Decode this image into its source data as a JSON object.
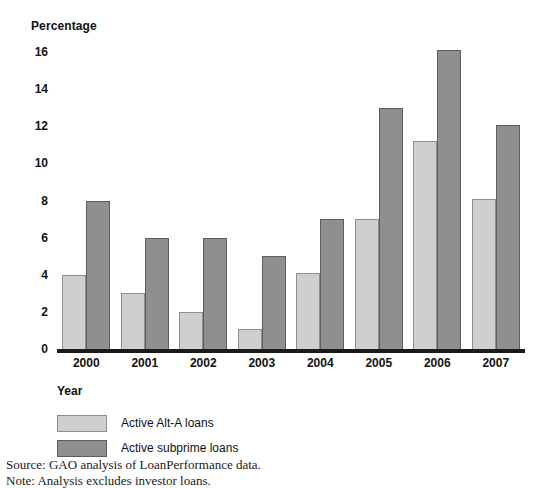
{
  "chart_data": {
    "type": "bar",
    "title": "",
    "ylabel": "Percentage",
    "xlabel": "Year",
    "categories": [
      "2000",
      "2001",
      "2002",
      "2003",
      "2004",
      "2005",
      "2006",
      "2007"
    ],
    "series": [
      {
        "name": "Active Alt-A loans",
        "color": "#cfcfcf",
        "values": [
          4.0,
          3.0,
          2.0,
          1.1,
          4.1,
          7.0,
          11.2,
          8.1
        ]
      },
      {
        "name": "Active subprime loans",
        "color": "#8f8f8f",
        "values": [
          8.0,
          6.0,
          6.0,
          5.0,
          7.0,
          13.0,
          16.1,
          12.1
        ]
      }
    ],
    "ylim": [
      0,
      16.6
    ],
    "yticks": [
      0,
      2,
      4,
      6,
      8,
      10,
      12,
      14,
      16
    ],
    "ytick_labels": [
      "0",
      "2",
      "4",
      "6",
      "8",
      "10",
      "12",
      "14",
      "16"
    ],
    "grid": false,
    "legend_position": "below-axis-left"
  },
  "legend": {
    "items": [
      {
        "label": "Active Alt-A loans",
        "swatch": "alta"
      },
      {
        "label": "Active subprime loans",
        "swatch": "subprime"
      }
    ]
  },
  "footnotes": {
    "source": "Source: GAO analysis of LoanPerformance data.",
    "note": "Note: Analysis excludes investor loans."
  }
}
